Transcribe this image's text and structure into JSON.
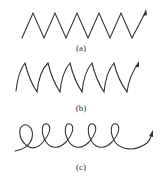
{
  "figure": {
    "panels": [
      {
        "id": "a",
        "label": "(a)",
        "type": "triangle-wave"
      },
      {
        "id": "b",
        "label": "(b)",
        "type": "sawtooth-wave"
      },
      {
        "id": "c",
        "label": "(c)",
        "type": "helix-coil"
      }
    ],
    "stroke_color": "#333333"
  }
}
